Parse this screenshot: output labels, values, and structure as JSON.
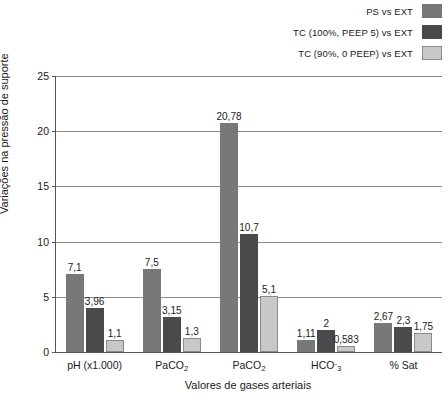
{
  "chart_data": {
    "type": "bar",
    "title": "",
    "subtitle": "",
    "xlabel": "Valores de gases arteriais",
    "ylabel": "Variações na pressão de suporte",
    "ylim": [
      0,
      25
    ],
    "yticks": [
      "0",
      "5",
      "10",
      "15",
      "20",
      "25"
    ],
    "ytick_values": [
      0,
      5,
      10,
      15,
      20,
      25
    ],
    "grid": "horizontal",
    "legend_position": "top-right",
    "categories": [
      "pH (x1.000)",
      "PaCO2",
      "PaCO2",
      "HCO-3",
      "% Sat"
    ],
    "category_labels_html": [
      "pH (x1.000)",
      "PaCO<sub>2</sub>",
      "PaCO<sub>2</sub>",
      "HCO<sup>-</sup><sub>3</sub>",
      "% Sat"
    ],
    "series": [
      {
        "name": "PS vs EXT",
        "color": "#787878",
        "border": "#787878",
        "values": [
          7.1,
          7.5,
          20.78,
          1.11,
          2.67
        ],
        "labels": [
          "7,1",
          "7,5",
          "20,78",
          "1,11",
          "2,67"
        ]
      },
      {
        "name": "TC (100%, PEEP 5) vs EXT",
        "color": "#4a4a4a",
        "border": "#4a4a4a",
        "values": [
          3.96,
          3.15,
          10.7,
          2.0,
          2.3
        ],
        "labels": [
          "3,96",
          "3,15",
          "10,7",
          "2",
          "2,3"
        ]
      },
      {
        "name": "TC (90%, 0 PEEP) vs EXT",
        "color": "#c8c8c8",
        "border": "#8a8a8a",
        "values": [
          1.1,
          1.3,
          5.1,
          0.583,
          1.75
        ],
        "labels": [
          "1,1",
          "1,3",
          "5,1",
          "0,583",
          "1,75"
        ]
      }
    ]
  }
}
